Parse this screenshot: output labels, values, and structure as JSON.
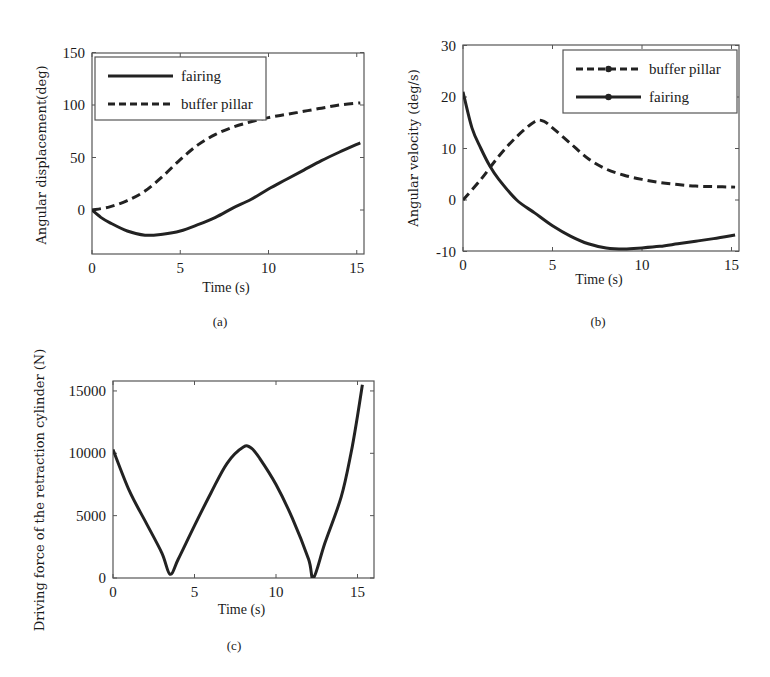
{
  "colors": {
    "line": "#222222",
    "axis": "#555555",
    "background": "#ffffff"
  },
  "chart_data": [
    {
      "id": "a",
      "type": "line",
      "caption": "(a)",
      "title": "",
      "xlabel": "Time (s)",
      "ylabel": "Angular displacement(deg)",
      "xlim": [
        0,
        15.5
      ],
      "ylim": [
        -42,
        150
      ],
      "xticks": [
        0,
        5,
        10,
        15
      ],
      "yticks": [
        0,
        50,
        100,
        150
      ],
      "grid": false,
      "legend_position": "upper left",
      "series": [
        {
          "name": "fairing",
          "style": "solid",
          "x": [
            0,
            0.5,
            1,
            2,
            3,
            4,
            5,
            6,
            7,
            8,
            9,
            10,
            11,
            12,
            13,
            14,
            15.2
          ],
          "y": [
            0,
            -7,
            -12,
            -20,
            -24,
            -23,
            -20,
            -14,
            -7,
            2,
            10,
            20,
            29,
            38,
            47,
            55,
            64
          ]
        },
        {
          "name": "buffer pillar",
          "style": "dashed",
          "x": [
            0,
            1,
            2,
            3,
            4,
            5,
            6,
            7,
            8,
            9,
            10,
            11,
            12,
            13,
            14,
            15.2
          ],
          "y": [
            0,
            3,
            9,
            18,
            32,
            48,
            62,
            72,
            79,
            84,
            88,
            91,
            94,
            97,
            100,
            102
          ]
        }
      ]
    },
    {
      "id": "b",
      "type": "line",
      "caption": "(b)",
      "title": "",
      "xlabel": "Time (s)",
      "ylabel": "Angular velocity (deg/s)",
      "xlim": [
        0,
        15.5
      ],
      "ylim": [
        -10,
        30
      ],
      "xticks": [
        0,
        5,
        10,
        15
      ],
      "yticks": [
        -10,
        0,
        10,
        20,
        30
      ],
      "grid": false,
      "legend_position": "upper right",
      "series": [
        {
          "name": "buffer pillar",
          "style": "dashed",
          "x": [
            0,
            1,
            2,
            3,
            4,
            4.5,
            5,
            6,
            7,
            8,
            9,
            10,
            11,
            12,
            13,
            14,
            15.2
          ],
          "y": [
            0,
            4,
            8.5,
            12.3,
            15.2,
            15.3,
            14,
            11,
            8,
            6,
            4.8,
            4,
            3.4,
            3,
            2.7,
            2.6,
            2.5
          ]
        },
        {
          "name": "fairing",
          "style": "solid",
          "x": [
            0,
            0.5,
            1,
            1.5,
            2,
            3,
            4,
            5,
            6,
            7,
            8,
            9,
            10,
            11,
            12,
            13,
            14,
            15.2
          ],
          "y": [
            21,
            14,
            10,
            6.6,
            4,
            0,
            -2.5,
            -5,
            -7,
            -8.5,
            -9.3,
            -9.5,
            -9.3,
            -9,
            -8.5,
            -8,
            -7.5,
            -6.8
          ]
        }
      ]
    },
    {
      "id": "c",
      "type": "line",
      "caption": "(c)",
      "title": "",
      "xlabel": "Time (s)",
      "ylabel": "Driving force of the retraction cylinder (N)",
      "xlim": [
        0,
        16
      ],
      "ylim": [
        0,
        15800
      ],
      "xticks": [
        0,
        5,
        10,
        15
      ],
      "yticks": [
        0,
        5000,
        10000,
        15000
      ],
      "grid": false,
      "legend_position": "none",
      "series": [
        {
          "name": "driving force",
          "style": "solid",
          "x": [
            0,
            1,
            2,
            3,
            3.5,
            4,
            5,
            6,
            7,
            8,
            8.5,
            9,
            10,
            11,
            12,
            12.3,
            13,
            14,
            14.6,
            15,
            15.3
          ],
          "y": [
            10300,
            7000,
            4500,
            2000,
            300,
            1500,
            4200,
            6800,
            9200,
            10500,
            10400,
            9600,
            7500,
            4800,
            1500,
            0,
            2800,
            6500,
            10000,
            13000,
            15500
          ]
        }
      ]
    }
  ]
}
